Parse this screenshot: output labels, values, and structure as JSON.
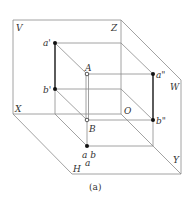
{
  "figure": {
    "caption": "(a)",
    "planes": {
      "V": "V",
      "W": "W",
      "H": "H"
    },
    "axes": {
      "X": "X",
      "Y": "Y",
      "Z": "Z",
      "O": "O"
    },
    "points": {
      "A": "A",
      "B": "B",
      "a_prime": "a'",
      "b_prime": "b'",
      "a_double_prime": "a\"",
      "b_double_prime": "b\"",
      "ab_top": "a b",
      "ab_bottom": "a"
    },
    "colors": {
      "line": "#8a8a8a",
      "thick_line": "#333333",
      "point": "#111111"
    }
  }
}
